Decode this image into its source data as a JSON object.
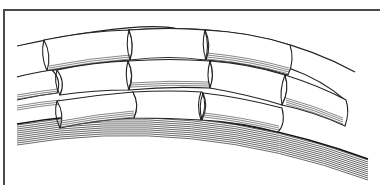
{
  "figure": {
    "rows_of_segments": 3,
    "colors": {
      "line": "#222222",
      "hatch": "#555555",
      "fill": "#ffffff",
      "frame": "#4a4a4a"
    }
  }
}
